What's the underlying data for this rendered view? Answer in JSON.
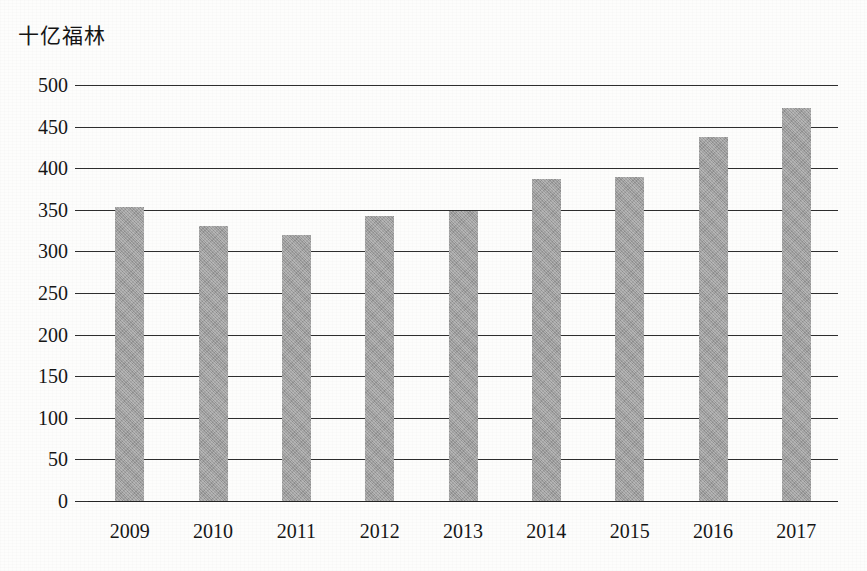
{
  "chart_data": {
    "type": "bar",
    "title": "",
    "subtitle": "",
    "xlabel": "",
    "ylabel": "十亿福林",
    "categories": [
      "2009",
      "2010",
      "2011",
      "2012",
      "2013",
      "2014",
      "2015",
      "2016",
      "2017"
    ],
    "values": [
      353,
      330,
      320,
      343,
      348,
      387,
      390,
      438,
      472
    ],
    "series": [
      {
        "name": "",
        "values": [
          353,
          330,
          320,
          343,
          348,
          387,
          390,
          438,
          472
        ]
      }
    ],
    "ylim": [
      0,
      500
    ],
    "ytick_step": 50,
    "yticks": [
      500,
      450,
      400,
      350,
      300,
      250,
      200,
      150,
      100,
      50,
      0
    ],
    "ytick_labels": [
      "500",
      "450",
      "400",
      "350",
      "300",
      "250",
      "200",
      "150",
      "100",
      "50",
      "0"
    ],
    "grid": true,
    "grid_axis": "y",
    "legend": false,
    "legend_position": "none",
    "annotations": [],
    "colors": {
      "bar_fill": "#9c9c9c",
      "gridline": "#2e2e2e",
      "axis": "#242424",
      "text": "#161616",
      "background": "#fdfdfc"
    }
  }
}
